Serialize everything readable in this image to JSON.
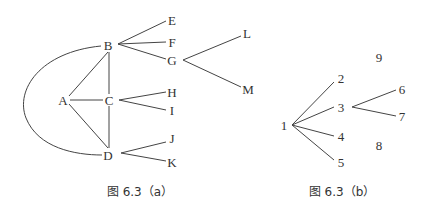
{
  "figure_a": {
    "caption": "图 6.3（a）",
    "nodes": {
      "A": "A",
      "B": "B",
      "C": "C",
      "D": "D",
      "E": "E",
      "F": "F",
      "G": "G",
      "H": "H",
      "I": "I",
      "J": "J",
      "K": "K",
      "L": "L",
      "M": "M"
    },
    "edges": [
      [
        "A",
        "B"
      ],
      [
        "A",
        "C"
      ],
      [
        "A",
        "D"
      ],
      [
        "B",
        "C"
      ],
      [
        "C",
        "D"
      ],
      [
        "B",
        "D",
        "curved"
      ],
      [
        "B",
        "E"
      ],
      [
        "B",
        "F"
      ],
      [
        "B",
        "G"
      ],
      [
        "G",
        "L"
      ],
      [
        "G",
        "M"
      ],
      [
        "C",
        "H"
      ],
      [
        "C",
        "I"
      ],
      [
        "D",
        "J"
      ],
      [
        "D",
        "K"
      ]
    ]
  },
  "figure_b": {
    "caption": "图 6.3（b）",
    "nodes": {
      "n1": "1",
      "n2": "2",
      "n3": "3",
      "n4": "4",
      "n5": "5",
      "n6": "6",
      "n7": "7",
      "n8": "8",
      "n9": "9"
    },
    "edges": [
      [
        "1",
        "2"
      ],
      [
        "1",
        "3"
      ],
      [
        "1",
        "4"
      ],
      [
        "1",
        "5"
      ],
      [
        "3",
        "6"
      ],
      [
        "3",
        "7"
      ]
    ],
    "isolated": [
      "8",
      "9"
    ]
  }
}
